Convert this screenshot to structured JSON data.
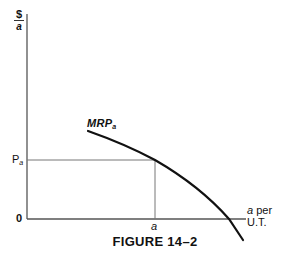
{
  "figure": {
    "caption": "FIGURE 14–2",
    "y_axis_label": {
      "numerator": "$",
      "denominator": "a"
    },
    "x_axis_label": {
      "line1_var": "a",
      "line1_rest": " per",
      "line2": "U.T."
    },
    "origin_label": "0",
    "price_label": {
      "base": "P",
      "sub": "a"
    },
    "quantity_label": "a",
    "curve_label": {
      "base": "MRP",
      "sub": "a"
    }
  },
  "colors": {
    "axis": "#555555",
    "curve": "#111111",
    "guide": "#777777",
    "background": "#ffffff"
  }
}
